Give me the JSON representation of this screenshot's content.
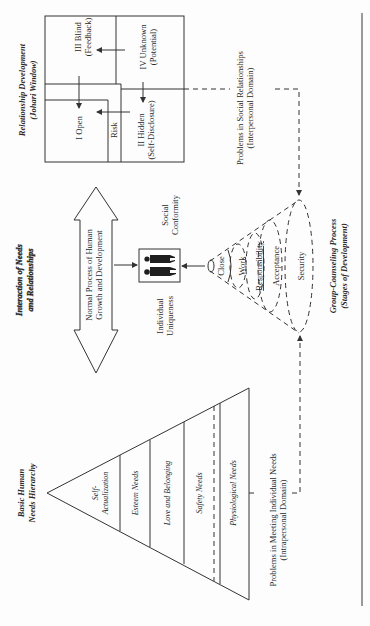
{
  "sections": {
    "johari": {
      "title_line1": "Relationship Development",
      "title_line2": "(Johari Window)",
      "quadrants": {
        "open": "I Open",
        "blind_line1": "III Blind",
        "blind_line2": "(Feedback)",
        "hidden_line1": "II Hidden",
        "hidden_line2": "(Self-Disclosure)",
        "unknown_line1": "IV Unknown",
        "unknown_line2": "(Potential)"
      },
      "risk_label": "Risk",
      "problems_line1": "Problems in Social Relationships",
      "problems_line2": "(Interpersonal Domain)"
    },
    "interaction": {
      "title_line1": "Interaction of Needs",
      "title_line2": "and Relationships",
      "arrow_line1": "Normal Process of Human",
      "arrow_line2": "Growth and Development",
      "social_line1": "Social",
      "social_line2": "Conformity",
      "individual_line1": "Individual",
      "individual_line2": "Uniqueness"
    },
    "group": {
      "title_line1": "Group-Counseling Process",
      "title_line2": "(Stages of Development)",
      "stages": [
        "Close",
        "Work",
        "Responsibility",
        "Acceptance",
        "Security"
      ]
    },
    "maslow": {
      "title_line1": "Basic Human",
      "title_line2": "Needs Hierarchy",
      "levels": {
        "self_line1": "Self-",
        "self_line2": "Actualization",
        "esteem": "Esteem Needs",
        "love": "Love and Belonging",
        "safety": "Safety Needs",
        "physiological": "Physiological Needs"
      },
      "problems_line1": "Problems in Meeting Individual Needs",
      "problems_line2": "(Intrapersonal Domain)"
    }
  },
  "colors": {
    "ink": "#333333",
    "paper": "#fdfdfd",
    "rule": "#9a9a9a"
  }
}
